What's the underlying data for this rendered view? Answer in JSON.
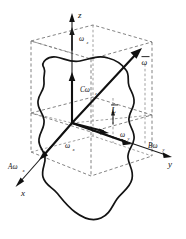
{
  "figure": {
    "background_color": "#ffffff",
    "line_color": "#111111",
    "dashed_color": "#5a5a5a",
    "width": 186,
    "height": 239
  },
  "axes": {
    "x": {
      "label": "x",
      "arrow": "down-left"
    },
    "y": {
      "label": "y",
      "arrow": "right"
    },
    "z": {
      "label": "z",
      "arrow": "up"
    }
  },
  "vectors": {
    "omega": {
      "label": "ω",
      "overbar": true,
      "description": "resultant angular velocity vector"
    },
    "omega_x": {
      "label": "ω",
      "subscript": "x"
    },
    "omega_y": {
      "label": "ω",
      "subscript": "y"
    },
    "omega_z": {
      "label": "ω",
      "subscript": "z"
    },
    "L": {
      "label": "L",
      "overbar": true,
      "description": "angular momentum vector"
    }
  },
  "moment_labels": {
    "A": {
      "text": "Aω",
      "subscript": "x",
      "position": "lower-left"
    },
    "B": {
      "text": "Bω",
      "subscript": "y",
      "position": "lower-right"
    },
    "C": {
      "text": "Cω",
      "subscript": "z",
      "position": "center-upper"
    }
  },
  "body": {
    "name": "rigid-body-outline",
    "style": "irregular closed freehand contour"
  },
  "construction": {
    "box": "dashed rectangular parallelepiped showing component projections",
    "projection_lines": "dashed"
  }
}
